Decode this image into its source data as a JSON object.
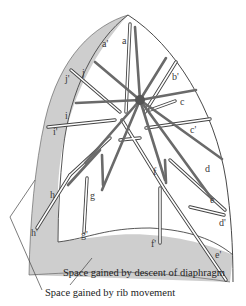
{
  "figure": {
    "type": "diagram",
    "colors": {
      "shaded_area": "#cfcfcf",
      "outline": "#333333",
      "rod_dark": "#6e6e6e",
      "rod_light": "#ffffff",
      "background": "#ffffff"
    }
  },
  "labels": {
    "a_prime": "a'",
    "a": "a",
    "b_prime": "b'",
    "c": "c",
    "c_prime": "c'",
    "d": "d",
    "d_prime": "d'",
    "e": "e",
    "e_prime": "e'",
    "f": "f",
    "f_prime": "f'",
    "g": "g",
    "g_prime": "g'",
    "h": "h",
    "h_prime": "h'",
    "i": "i",
    "i_prime": "i'",
    "j": "j",
    "j_prime": "j'"
  },
  "captions": {
    "diaphragm": "Space gained by descent of diaphragm",
    "ribs": "Space gained by rib movement"
  }
}
